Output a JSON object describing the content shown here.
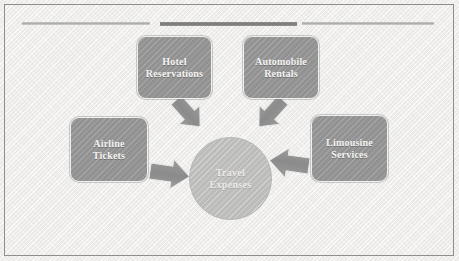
{
  "diagram": {
    "title": "Travel Expenses",
    "type": "converging-arrow-hub-and-spoke",
    "background_color": "#f2f1ef",
    "frame_color": "#8e8e8e",
    "box_fill_color": "#9a9a9a",
    "circle_fill_color": "#c3c3c2",
    "arrow_fill_color": "#8f8f8f",
    "label_color": "#f5f4f2",
    "rules": [
      {
        "name": "rule-left",
        "color": "#bfbfbf",
        "emphasis": "light"
      },
      {
        "name": "rule-center",
        "color": "#7f7f7f",
        "emphasis": "dark"
      },
      {
        "name": "rule-right",
        "color": "#bfbfbf",
        "emphasis": "light"
      }
    ],
    "center": {
      "label": "Travel\nExpenses",
      "shape": "circle"
    },
    "nodes": [
      {
        "id": "hotel",
        "label": "Hotel\nReservations",
        "position": "top-left",
        "arrow_direction": "down-right"
      },
      {
        "id": "automobile",
        "label": "Automobile\nRentals",
        "position": "top-right",
        "arrow_direction": "down-left"
      },
      {
        "id": "airline",
        "label": "Airline\nTickets",
        "position": "middle-left",
        "arrow_direction": "right"
      },
      {
        "id": "limousine",
        "label": "Limousine\nServices",
        "position": "middle-right",
        "arrow_direction": "left"
      }
    ]
  }
}
